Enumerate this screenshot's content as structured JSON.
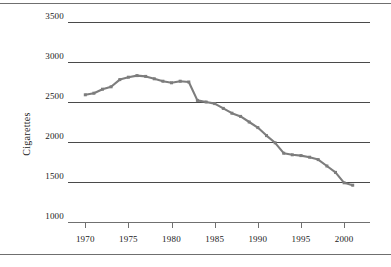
{
  "chart_data": {
    "type": "line",
    "title": "",
    "xlabel": "",
    "ylabel": "Cigarettes",
    "xlim": [
      1968,
      2003
    ],
    "ylim": [
      1000,
      3500
    ],
    "grid": true,
    "legend": false,
    "line_color": "#7d7d7d",
    "marker": "square",
    "xticks": [
      1970,
      1975,
      1980,
      1985,
      1990,
      1995,
      2000
    ],
    "xtick_labels": [
      "1970",
      "1975",
      "1980",
      "1985",
      "1990",
      "1995",
      "2000"
    ],
    "yticks": [
      1000,
      1500,
      2000,
      2500,
      3000,
      3500
    ],
    "ytick_labels": [
      "1000",
      "1500",
      "2000",
      "2500",
      "3000",
      "3500"
    ],
    "x": [
      1970,
      1971,
      1972,
      1973,
      1974,
      1975,
      1976,
      1977,
      1978,
      1979,
      1980,
      1981,
      1982,
      1983,
      1984,
      1985,
      1986,
      1987,
      1988,
      1989,
      1990,
      1991,
      1992,
      1993,
      1994,
      1995,
      1996,
      1997,
      1998,
      1999,
      2000,
      2001
    ],
    "values": [
      2590,
      2610,
      2660,
      2690,
      2780,
      2810,
      2830,
      2820,
      2790,
      2760,
      2740,
      2760,
      2750,
      2520,
      2500,
      2480,
      2420,
      2360,
      2320,
      2250,
      2180,
      2080,
      1990,
      1860,
      1840,
      1830,
      1810,
      1780,
      1700,
      1620,
      1490,
      1460
    ],
    "series": [
      {
        "name": "Cigarettes",
        "values": [
          2590,
          2610,
          2660,
          2690,
          2780,
          2810,
          2830,
          2820,
          2790,
          2760,
          2740,
          2760,
          2750,
          2520,
          2500,
          2480,
          2420,
          2360,
          2320,
          2250,
          2180,
          2080,
          1990,
          1860,
          1840,
          1830,
          1810,
          1780,
          1700,
          1620,
          1490,
          1460
        ]
      }
    ]
  },
  "figure": {
    "ylabel": "Cigarettes"
  }
}
